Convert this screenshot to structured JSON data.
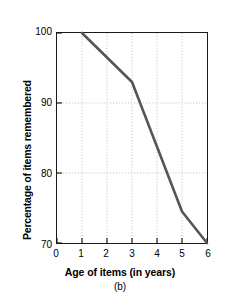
{
  "chart_data": {
    "type": "line",
    "title": "",
    "subtitle": "",
    "caption": "(b)",
    "xlabel": "Age of items (in years)",
    "ylabel": "Percentage of items remembered",
    "xlim": [
      0,
      6
    ],
    "ylim": [
      70,
      100
    ],
    "xticks": [
      "0",
      "1",
      "2",
      "3",
      "4",
      "5",
      "6"
    ],
    "xtick_values": [
      0,
      1,
      2,
      3,
      4,
      5,
      6
    ],
    "yticks": [
      "100",
      "90",
      "80",
      "70"
    ],
    "ytick_values": [
      100,
      90,
      80,
      70
    ],
    "grid": true,
    "grid_style": "dotted",
    "grid_x_values": [
      1,
      2,
      3,
      4,
      5
    ],
    "grid_y_values": [
      90,
      80
    ],
    "legend": null,
    "series": [
      {
        "name": "Percentage of items remembered",
        "color": "#555555",
        "x": [
          1,
          3,
          5,
          6
        ],
        "values": [
          100,
          93,
          74.5,
          70
        ]
      }
    ]
  },
  "colors": {
    "line": "#555555",
    "axis": "#1a1a1a",
    "grid": "#bbbbbb",
    "background": "#ffffff",
    "text": "#000000"
  }
}
